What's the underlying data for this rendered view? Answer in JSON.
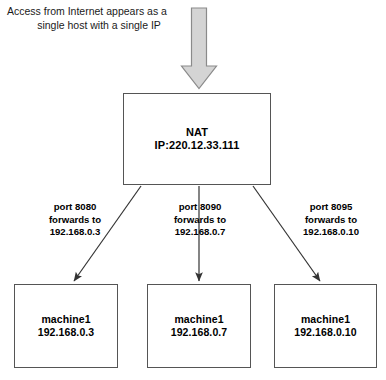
{
  "diagram": {
    "header_note": {
      "line1": "Access from Internet appears as a",
      "line2": "single host with a single IP"
    },
    "inbound_arrow": {
      "icon": "down-block-arrow-icon",
      "fill_color": "#d4d4d4",
      "stroke_color": "#8a8a8a"
    },
    "nat_node": {
      "title": "NAT",
      "address": "IP:220.12.33.111"
    },
    "connections": [
      {
        "port_line": "port 8080",
        "forwards_line": "forwards to",
        "target_line": "192.168.0.3"
      },
      {
        "port_line": "port 8090",
        "forwards_line": "forwards to",
        "target_line": "192.168.0.7"
      },
      {
        "port_line": "port 8095",
        "forwards_line": "forwards to",
        "target_line": "192.168.0.10"
      }
    ],
    "machines": [
      {
        "name": "machine1",
        "address": "192.168.0.3"
      },
      {
        "name": "machine1",
        "address": "192.168.0.7"
      },
      {
        "name": "machine1",
        "address": "192.168.0.10"
      }
    ],
    "colors": {
      "box_border": "#555555",
      "line": "#333333",
      "background": "#ffffff"
    },
    "bottom_caption": ""
  }
}
